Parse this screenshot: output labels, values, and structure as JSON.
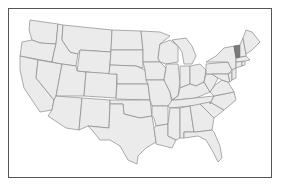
{
  "map": {
    "type": "us-states-choropleth",
    "region": "Contiguous United States",
    "highlighted_states": [
      "Vermont"
    ],
    "colors": {
      "frame_border": "#555555",
      "state_fill": "#ebebeb",
      "state_border": "#8a8a8a",
      "highlight_fill": "#7a7a7a",
      "background": "#ffffff"
    },
    "states": [
      {
        "id": "WA",
        "name": "Washington",
        "highlight": false,
        "points": "30,20 58,24 56,44 40,43 32,40 29,30"
      },
      {
        "id": "OR",
        "name": "Oregon",
        "highlight": false,
        "points": "22,42 32,40 40,43 56,44 54,52 52,62 20,56"
      },
      {
        "id": "CA",
        "name": "California",
        "highlight": false,
        "points": "20,56 38,60 36,78 54,100 52,110 40,112 32,100 24,88 20,70"
      },
      {
        "id": "NV",
        "name": "Nevada",
        "highlight": false,
        "points": "38,60 62,64 56,96 54,100 36,78"
      },
      {
        "id": "ID",
        "name": "Idaho",
        "highlight": false,
        "points": "58,24 63,25 62,40 70,52 78,54 76,66 62,64 52,62 54,52 56,44"
      },
      {
        "id": "MT",
        "name": "Montana",
        "highlight": false,
        "points": "63,25 112,30 111,52 80,50 78,54 70,52 62,40"
      },
      {
        "id": "WY",
        "name": "Wyoming",
        "highlight": false,
        "points": "80,50 111,52 109,74 77,71"
      },
      {
        "id": "UT",
        "name": "Utah",
        "highlight": false,
        "points": "62,64 76,66 77,71 86,72 84,96 56,96"
      },
      {
        "id": "CO",
        "name": "Colorado",
        "highlight": false,
        "points": "86,72 117,74 116,98 84,96"
      },
      {
        "id": "AZ",
        "name": "Arizona",
        "highlight": false,
        "points": "56,96 82,98 79,130 66,128 48,116 52,110 54,100"
      },
      {
        "id": "NM",
        "name": "New Mexico",
        "highlight": false,
        "points": "82,98 110,100 109,128 88,126 79,130"
      },
      {
        "id": "ND",
        "name": "North Dakota",
        "highlight": false,
        "points": "112,30 141,31 143,50 111,50"
      },
      {
        "id": "SD",
        "name": "South Dakota",
        "highlight": false,
        "points": "111,50 143,50 143,68 136,66 110,65"
      },
      {
        "id": "NE",
        "name": "Nebraska",
        "highlight": false,
        "points": "110,65 136,66 145,70 148,84 117,84 117,74 109,74"
      },
      {
        "id": "KS",
        "name": "Kansas",
        "highlight": false,
        "points": "117,84 148,84 150,100 116,99"
      },
      {
        "id": "OK",
        "name": "Oklahoma",
        "highlight": false,
        "points": "110,100 150,100 152,116 140,118 124,114 123,104 110,104"
      },
      {
        "id": "TX",
        "name": "Texas",
        "highlight": false,
        "points": "110,104 123,104 124,114 140,118 152,116 154,128 156,142 146,148 138,156 137,164 128,160 120,146 110,140 100,140 92,130 88,126 109,128"
      },
      {
        "id": "MN",
        "name": "Minnesota",
        "highlight": false,
        "points": "141,31 160,32 170,36 160,44 158,58 160,62 143,62 143,50"
      },
      {
        "id": "IA",
        "name": "Iowa",
        "highlight": false,
        "points": "143,62 160,62 166,68 164,80 146,80 145,70"
      },
      {
        "id": "MO",
        "name": "Missouri",
        "highlight": false,
        "points": "146,80 164,80 170,92 172,104 168,106 152,106 150,100 148,84"
      },
      {
        "id": "AR",
        "name": "Arkansas",
        "highlight": false,
        "points": "152,106 168,106 168,124 156,126 154,118 152,116"
      },
      {
        "id": "LA",
        "name": "Louisiana",
        "highlight": false,
        "points": "156,126 168,124 168,136 176,140 172,148 156,144 156,142 154,128"
      },
      {
        "id": "WI",
        "name": "Wisconsin",
        "highlight": false,
        "points": "160,44 170,40 178,46 178,62 166,64 160,62 158,58"
      },
      {
        "id": "IL",
        "name": "Illinois",
        "highlight": false,
        "points": "166,64 178,64 180,82 178,96 172,100 170,92 164,80 166,68"
      },
      {
        "id": "MI",
        "name": "Michigan",
        "highlight": false,
        "points": "172,40 186,38 192,46 196,56 192,64 184,64 182,52 178,46"
      },
      {
        "id": "IN",
        "name": "Indiana",
        "highlight": false,
        "points": "180,66 190,66 190,84 180,88 180,82"
      },
      {
        "id": "OH",
        "name": "Ohio",
        "highlight": false,
        "points": "190,66 200,64 206,70 204,82 196,86 190,84"
      },
      {
        "id": "KY",
        "name": "Kentucky",
        "highlight": false,
        "points": "172,100 178,96 180,88 190,84 196,86 204,82 210,92 196,98 176,100"
      },
      {
        "id": "TN",
        "name": "Tennessee",
        "highlight": false,
        "points": "168,106 172,100 176,100 214,96 210,104 170,108"
      },
      {
        "id": "MS",
        "name": "Mississippi",
        "highlight": false,
        "points": "170,108 180,108 180,138 176,140 168,136 168,124"
      },
      {
        "id": "AL",
        "name": "Alabama",
        "highlight": false,
        "points": "180,108 190,106 194,132 184,132 184,138 180,138"
      },
      {
        "id": "GA",
        "name": "Georgia",
        "highlight": false,
        "points": "190,106 200,104 214,118 212,130 196,132 194,132"
      },
      {
        "id": "FL",
        "name": "Florida",
        "highlight": false,
        "points": "184,132 196,132 212,130 214,132 220,146 222,158 218,162 212,150 206,140 198,136 184,138"
      },
      {
        "id": "SC",
        "name": "South Carolina",
        "highlight": false,
        "points": "200,104 210,102 224,110 214,118"
      },
      {
        "id": "NC",
        "name": "North Carolina",
        "highlight": false,
        "points": "210,104 214,96 234,92 236,100 224,110 210,102"
      },
      {
        "id": "VA",
        "name": "Virginia",
        "highlight": false,
        "points": "210,92 214,86 222,80 228,82 234,92 214,96"
      },
      {
        "id": "WV",
        "name": "West Virginia",
        "highlight": false,
        "points": "204,82 206,74 212,74 218,78 214,86 210,92"
      },
      {
        "id": "PA",
        "name": "Pennsylvania",
        "highlight": false,
        "points": "206,64 228,62 232,70 228,74 212,74 206,74"
      },
      {
        "id": "NY",
        "name": "New York",
        "highlight": false,
        "points": "206,62 216,56 224,48 234,46 236,58 236,68 232,70 228,62"
      },
      {
        "id": "MD",
        "name": "Maryland",
        "highlight": false,
        "points": "212,74 228,74 230,82 228,82 222,80 218,78"
      },
      {
        "id": "DE",
        "name": "Delaware",
        "highlight": false,
        "points": "228,74 232,72 232,80 230,82"
      },
      {
        "id": "NJ",
        "name": "New Jersey",
        "highlight": false,
        "points": "232,70 236,68 236,78 232,80 232,72"
      },
      {
        "id": "CT",
        "name": "Connecticut",
        "highlight": false,
        "points": "236,62 242,61 242,66 236,68"
      },
      {
        "id": "RI",
        "name": "Rhode Island",
        "highlight": false,
        "points": "242,61 245,61 245,65 242,66"
      },
      {
        "id": "MA",
        "name": "Massachusetts",
        "highlight": false,
        "points": "236,58 246,56 250,60 245,61 236,62"
      },
      {
        "id": "VT",
        "name": "Vermont",
        "highlight": true,
        "points": "234,46 240,45 240,57 236,58"
      },
      {
        "id": "NH",
        "name": "New Hampshire",
        "highlight": false,
        "points": "240,45 243,38 246,54 246,56 240,57"
      },
      {
        "id": "ME",
        "name": "Maine",
        "highlight": false,
        "points": "243,38 246,30 252,32 260,42 252,50 246,54"
      }
    ]
  }
}
